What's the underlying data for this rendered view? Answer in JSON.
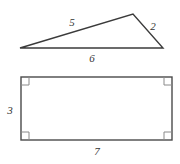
{
  "figure": {
    "background_color": "#ffffff",
    "stroke_color": "#3b3b3b",
    "rect_stroke_color": "#4a4a4a",
    "label_color": "#333333"
  },
  "shapes": {
    "triangle": {
      "name": "scalene-triangle",
      "vertices": [
        {
          "name": "left-vertex",
          "x": 20,
          "y": 48
        },
        {
          "name": "apex-vertex",
          "x": 133,
          "y": 14
        },
        {
          "name": "right-vertex",
          "x": 163,
          "y": 48
        }
      ],
      "sides": [
        {
          "name": "triangle-side-left",
          "label": "5",
          "label_x": 72,
          "label_y": 22
        },
        {
          "name": "triangle-side-right",
          "label": "2",
          "label_x": 153,
          "label_y": 26
        },
        {
          "name": "triangle-side-base",
          "label": "6",
          "label_x": 92,
          "label_y": 58
        }
      ]
    },
    "rectangle": {
      "name": "rectangle",
      "x": 21,
      "y": 77,
      "width": 151,
      "height": 63,
      "right_angle_marks": 4,
      "right_angle_mark_size": 7,
      "sides": [
        {
          "name": "rectangle-side-left",
          "label": "3",
          "label_x": 10,
          "label_y": 110
        },
        {
          "name": "rectangle-side-bottom",
          "label": "7",
          "label_x": 97,
          "label_y": 151
        }
      ]
    }
  },
  "labels": {
    "triangle_left": "5",
    "triangle_right": "2",
    "triangle_base": "6",
    "rectangle_height": "3",
    "rectangle_width": "7"
  }
}
